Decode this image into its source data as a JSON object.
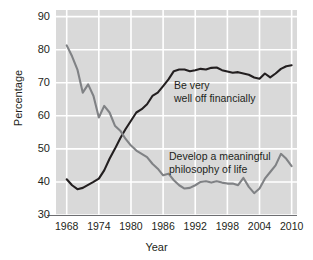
{
  "chart_data": {
    "type": "line",
    "title": "",
    "xlabel": "Year",
    "ylabel": "Percentage",
    "xlim": [
      1966,
      2011
    ],
    "ylim": [
      30,
      92
    ],
    "grid": true,
    "legend": "annotations-inline",
    "xticks": [
      1968,
      1974,
      1980,
      1986,
      1992,
      1998,
      2004,
      2010
    ],
    "yticks": [
      30,
      40,
      50,
      60,
      70,
      80,
      90
    ],
    "background": "#d9d9d9",
    "gridline_color": "#ffffff",
    "series": [
      {
        "name": "Be very well off financially",
        "color": "#231f20",
        "x": [
          1968,
          1969,
          1970,
          1971,
          1972,
          1973,
          1974,
          1975,
          1976,
          1977,
          1978,
          1979,
          1980,
          1981,
          1982,
          1983,
          1984,
          1985,
          1986,
          1987,
          1988,
          1989,
          1990,
          1991,
          1992,
          1993,
          1994,
          1995,
          1996,
          1997,
          1998,
          1999,
          2000,
          2001,
          2002,
          2003,
          2004,
          2005,
          2006,
          2007,
          2008,
          2009,
          2010
        ],
        "values": [
          40.8,
          39.0,
          37.8,
          38.2,
          39.1,
          40.0,
          41.0,
          43.5,
          47.0,
          50.0,
          53.2,
          56.0,
          58.5,
          61.0,
          62.0,
          63.5,
          66.0,
          67.0,
          69.0,
          71.0,
          73.5,
          74.0,
          74.0,
          73.5,
          73.8,
          74.2,
          74.0,
          74.5,
          74.6,
          73.8,
          73.4,
          73.0,
          73.2,
          72.8,
          72.4,
          71.6,
          71.2,
          72.8,
          71.6,
          72.8,
          74.2,
          75.0,
          75.3
        ]
      },
      {
        "name": "Develop a meaningful philosophy of life",
        "color": "#808285",
        "x": [
          1968,
          1969,
          1970,
          1971,
          1972,
          1973,
          1974,
          1975,
          1976,
          1977,
          1978,
          1979,
          1980,
          1981,
          1982,
          1983,
          1984,
          1985,
          1986,
          1987,
          1988,
          1989,
          1990,
          1991,
          1992,
          1993,
          1994,
          1995,
          1996,
          1997,
          1998,
          1999,
          2000,
          2001,
          2002,
          2003,
          2004,
          2005,
          2006,
          2007,
          2008,
          2009,
          2010
        ],
        "values": [
          81.3,
          78.0,
          74.0,
          67.0,
          69.5,
          66.0,
          59.5,
          63.0,
          61.0,
          57.0,
          55.5,
          53.0,
          51.0,
          49.5,
          48.5,
          47.5,
          45.5,
          44.0,
          42.0,
          42.5,
          40.5,
          39.0,
          38.0,
          38.2,
          39.0,
          40.0,
          40.2,
          39.8,
          40.2,
          39.8,
          39.5,
          39.5,
          39.0,
          41.2,
          38.5,
          36.6,
          38.0,
          41.0,
          43.0,
          45.0,
          48.5,
          47.0,
          44.8
        ]
      }
    ],
    "annotations": [
      {
        "name": "be-very-well-off-financially",
        "line1": "Be very",
        "line2": "well off financially"
      },
      {
        "name": "develop-a-meaningful-philosophy-of-life",
        "line1": "Develop a meaningful",
        "line2": "philosophy of life"
      }
    ]
  }
}
